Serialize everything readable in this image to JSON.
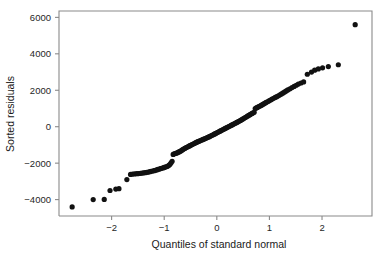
{
  "figure": {
    "name": "qq-plot-sorted-residuals",
    "background_color": "#ffffff",
    "axis_color": "#8a8a8a",
    "point_color": "#111111"
  },
  "chart_data": {
    "type": "scatter",
    "title": "",
    "subtitle": "",
    "xlabel": "Quantiles of standard normal",
    "ylabel": "Sorted residuals",
    "xlim": [
      -3.0,
      2.95
    ],
    "ylim": [
      -4900,
      6350
    ],
    "xticks": [
      -2,
      -1,
      0,
      1,
      2
    ],
    "xtick_labels": [
      "−2",
      "−1",
      "0",
      "1",
      "2"
    ],
    "yticks": [
      -4000,
      -2000,
      0,
      2000,
      4000,
      6000
    ],
    "ytick_labels": [
      "−4000",
      "−2000",
      "0",
      "2000",
      "4000",
      "6000"
    ],
    "grid": false,
    "legend": null,
    "marker": "filled-circle",
    "marker_size_px": 2.6,
    "annotations": [],
    "series": [
      {
        "name": "sorted residuals vs normal quantiles",
        "x": [
          -2.75,
          -2.35,
          -2.14,
          -2.03,
          -1.92,
          -1.86,
          -1.71,
          -1.64,
          -1.6,
          -1.56,
          -1.52,
          -1.49,
          -1.45,
          -1.42,
          -1.39,
          -1.36,
          -1.33,
          -1.3,
          -1.27,
          -1.25,
          -1.22,
          -1.19,
          -1.17,
          -1.14,
          -1.12,
          -1.09,
          -1.07,
          -1.05,
          -1.02,
          -1.0,
          -0.98,
          -0.95,
          -0.93,
          -0.91,
          -0.89,
          -0.87,
          -0.85,
          -0.83,
          -0.81,
          -0.79,
          -0.77,
          -0.75,
          -0.73,
          -0.71,
          -0.69,
          -0.67,
          -0.65,
          -0.63,
          -0.61,
          -0.59,
          -0.57,
          -0.55,
          -0.53,
          -0.51,
          -0.49,
          -0.47,
          -0.45,
          -0.43,
          -0.41,
          -0.39,
          -0.37,
          -0.35,
          -0.33,
          -0.31,
          -0.29,
          -0.27,
          -0.25,
          -0.23,
          -0.21,
          -0.19,
          -0.17,
          -0.15,
          -0.13,
          -0.11,
          -0.09,
          -0.07,
          -0.05,
          -0.03,
          -0.01,
          0.01,
          0.03,
          0.05,
          0.07,
          0.09,
          0.11,
          0.13,
          0.15,
          0.17,
          0.19,
          0.21,
          0.23,
          0.25,
          0.27,
          0.29,
          0.31,
          0.33,
          0.35,
          0.37,
          0.39,
          0.41,
          0.43,
          0.45,
          0.47,
          0.49,
          0.51,
          0.53,
          0.55,
          0.57,
          0.59,
          0.61,
          0.63,
          0.65,
          0.67,
          0.69,
          0.71,
          0.73,
          0.75,
          0.77,
          0.79,
          0.81,
          0.83,
          0.85,
          0.87,
          0.89,
          0.91,
          0.93,
          0.95,
          0.98,
          1.0,
          1.03,
          1.05,
          1.08,
          1.11,
          1.14,
          1.17,
          1.2,
          1.23,
          1.26,
          1.29,
          1.32,
          1.35,
          1.39,
          1.43,
          1.47,
          1.51,
          1.55,
          1.6,
          1.65,
          1.72,
          1.8,
          1.86,
          1.93,
          2.01,
          2.12,
          2.31,
          2.63
        ],
        "y": [
          -4400,
          -4000,
          -3990,
          -3500,
          -3420,
          -3400,
          -2900,
          -2620,
          -2600,
          -2590,
          -2580,
          -2570,
          -2560,
          -2545,
          -2530,
          -2520,
          -2505,
          -2490,
          -2470,
          -2450,
          -2430,
          -2410,
          -2390,
          -2370,
          -2345,
          -2320,
          -2300,
          -2280,
          -2260,
          -2235,
          -2210,
          -2185,
          -2160,
          -2120,
          -2060,
          -1980,
          -1900,
          -1520,
          -1490,
          -1470,
          -1450,
          -1430,
          -1400,
          -1370,
          -1340,
          -1300,
          -1260,
          -1225,
          -1190,
          -1160,
          -1130,
          -1100,
          -1070,
          -1040,
          -1010,
          -980,
          -950,
          -920,
          -890,
          -860,
          -835,
          -810,
          -785,
          -760,
          -735,
          -710,
          -685,
          -660,
          -635,
          -610,
          -585,
          -560,
          -530,
          -500,
          -470,
          -440,
          -410,
          -380,
          -350,
          -320,
          -290,
          -260,
          -230,
          -200,
          -170,
          -140,
          -110,
          -80,
          -50,
          -20,
          10,
          40,
          70,
          100,
          130,
          160,
          190,
          220,
          250,
          280,
          310,
          345,
          380,
          415,
          450,
          485,
          520,
          555,
          590,
          625,
          660,
          695,
          730,
          760,
          790,
          1000,
          1030,
          1060,
          1090,
          1120,
          1150,
          1180,
          1215,
          1250,
          1285,
          1320,
          1355,
          1395,
          1435,
          1475,
          1515,
          1560,
          1605,
          1650,
          1700,
          1750,
          1800,
          1855,
          1910,
          1965,
          2020,
          2080,
          2145,
          2210,
          2275,
          2340,
          2400,
          2460,
          2880,
          3000,
          3100,
          3170,
          3230,
          3300,
          3400,
          5600
        ]
      }
    ]
  }
}
